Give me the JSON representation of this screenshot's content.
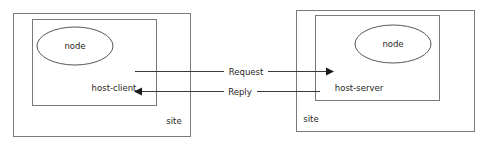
{
  "diagram": {
    "type": "client-server-site-topology",
    "colors": {
      "background": "#ffffff",
      "box_stroke": "#7a7a7a",
      "node_stroke": "#555555",
      "line": "#3a3a3a",
      "text": "#262626"
    },
    "left_site": {
      "site_label": "site",
      "host_label": "host-client",
      "node_label": "node"
    },
    "right_site": {
      "site_label": "site",
      "host_label": "host-server",
      "node_label": "node"
    },
    "flows": [
      {
        "label": "Request",
        "direction": "left-to-right"
      },
      {
        "label": "Reply",
        "direction": "right-to-left"
      }
    ]
  }
}
